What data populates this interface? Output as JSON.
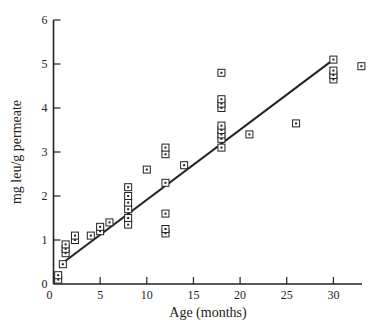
{
  "chart_data": {
    "type": "scatter",
    "title": "",
    "xlabel": "Age (months)",
    "ylabel": "mg leu/g permeate",
    "xlim": [
      0,
      34
    ],
    "ylim": [
      0,
      6
    ],
    "x_ticks": [
      0,
      5,
      10,
      15,
      20,
      25,
      30
    ],
    "y_ticks": [
      0,
      1,
      2,
      3,
      4,
      5,
      6
    ],
    "grid": false,
    "legend": null,
    "marker": "square-with-center-dot",
    "series": [
      {
        "name": "observations",
        "points": [
          [
            0.5,
            0.1
          ],
          [
            0.5,
            0.2
          ],
          [
            1.0,
            0.45
          ],
          [
            1.3,
            0.7
          ],
          [
            1.3,
            0.8
          ],
          [
            1.3,
            0.9
          ],
          [
            2.3,
            1.0
          ],
          [
            2.3,
            1.1
          ],
          [
            4.0,
            1.1
          ],
          [
            5.0,
            1.2
          ],
          [
            5.0,
            1.3
          ],
          [
            6.0,
            1.4
          ],
          [
            8.0,
            1.35
          ],
          [
            8.0,
            1.5
          ],
          [
            8.0,
            1.7
          ],
          [
            8.0,
            1.85
          ],
          [
            8.0,
            2.0
          ],
          [
            8.0,
            2.2
          ],
          [
            10.0,
            2.6
          ],
          [
            12.0,
            1.15
          ],
          [
            12.0,
            1.25
          ],
          [
            12.0,
            1.6
          ],
          [
            12.0,
            2.3
          ],
          [
            12.0,
            2.95
          ],
          [
            12.0,
            3.1
          ],
          [
            14.0,
            2.7
          ],
          [
            18.0,
            3.1
          ],
          [
            18.0,
            3.3
          ],
          [
            18.0,
            3.4
          ],
          [
            18.0,
            3.5
          ],
          [
            18.0,
            3.6
          ],
          [
            18.0,
            4.0
          ],
          [
            18.0,
            4.1
          ],
          [
            18.0,
            4.2
          ],
          [
            18.0,
            4.8
          ],
          [
            21.0,
            3.4
          ],
          [
            26.0,
            3.65
          ],
          [
            30.0,
            4.65
          ],
          [
            30.0,
            4.75
          ],
          [
            30.0,
            4.85
          ],
          [
            30.0,
            5.1
          ],
          [
            33.0,
            4.95
          ]
        ]
      }
    ],
    "fit_line": {
      "type": "linear",
      "x": [
        0.8,
        30.0
      ],
      "y": [
        0.45,
        5.1
      ]
    }
  },
  "axes": {
    "x_title": "Age (months)",
    "y_title": "mg leu/g permeate"
  },
  "colors": {
    "ink": "#222222",
    "background": "#ffffff"
  }
}
